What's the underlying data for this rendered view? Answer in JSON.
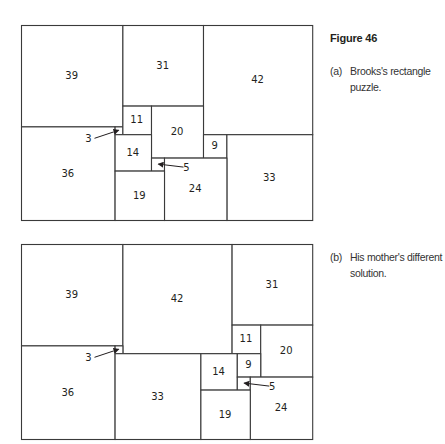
{
  "figure_title": "Figure 46",
  "colors": {
    "line": "#3a3a3a",
    "text": "#231f20",
    "background": "#ffffff"
  },
  "units": {
    "width": 112,
    "height": 75
  },
  "panels": [
    {
      "id": "a",
      "tag": "(a)",
      "caption": "Brooks's rectangle puzzle.",
      "squares": [
        {
          "size": 39,
          "x": 0,
          "y": 0
        },
        {
          "size": 31,
          "x": 39,
          "y": 0
        },
        {
          "size": 42,
          "x": 70,
          "y": 0
        },
        {
          "size": 36,
          "x": 0,
          "y": 39
        },
        {
          "size": 3,
          "x": 36,
          "y": 39
        },
        {
          "size": 11,
          "x": 39,
          "y": 31
        },
        {
          "size": 20,
          "x": 50,
          "y": 31
        },
        {
          "size": 14,
          "x": 36,
          "y": 42
        },
        {
          "size": 9,
          "x": 70,
          "y": 42
        },
        {
          "size": 33,
          "x": 79,
          "y": 42
        },
        {
          "size": 5,
          "x": 50,
          "y": 51
        },
        {
          "size": 24,
          "x": 55,
          "y": 51
        },
        {
          "size": 19,
          "x": 36,
          "y": 56
        }
      ],
      "callouts": [
        {
          "label": "3",
          "target_square": 3
        },
        {
          "label": "5",
          "target_square": 5
        }
      ]
    },
    {
      "id": "b",
      "tag": "(b)",
      "caption": "His mother's different solution.",
      "squares": [
        {
          "size": 39,
          "x": 0,
          "y": 0
        },
        {
          "size": 42,
          "x": 39,
          "y": 0
        },
        {
          "size": 31,
          "x": 81,
          "y": 0
        },
        {
          "size": 36,
          "x": 0,
          "y": 39
        },
        {
          "size": 3,
          "x": 36,
          "y": 39
        },
        {
          "size": 33,
          "x": 36,
          "y": 42
        },
        {
          "size": 11,
          "x": 81,
          "y": 31
        },
        {
          "size": 20,
          "x": 92,
          "y": 31
        },
        {
          "size": 14,
          "x": 69,
          "y": 42
        },
        {
          "size": 9,
          "x": 83,
          "y": 42
        },
        {
          "size": 5,
          "x": 83,
          "y": 51
        },
        {
          "size": 24,
          "x": 88,
          "y": 51
        },
        {
          "size": 19,
          "x": 69,
          "y": 56
        }
      ],
      "callouts": [
        {
          "label": "3",
          "target_square": 3
        },
        {
          "label": "5",
          "target_square": 5
        }
      ]
    }
  ]
}
